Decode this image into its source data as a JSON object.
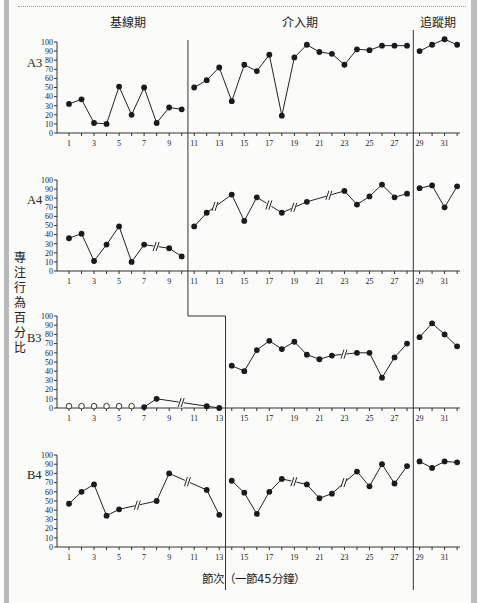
{
  "chart_data": {
    "type": "line",
    "subtype": "multiple-baseline single-subject design",
    "phases": [
      {
        "label": "基線期"
      },
      {
        "label": "介入期"
      },
      {
        "label": "追蹤期"
      }
    ],
    "ylabel": "專注行為百分比",
    "xlabel": "節次（一節45分鐘）",
    "ylim": [
      0,
      100
    ],
    "yticks": [
      0,
      10,
      20,
      30,
      40,
      50,
      60,
      70,
      80,
      90,
      100
    ],
    "xticks_labeled": [
      1,
      3,
      5,
      7,
      9,
      11,
      13,
      15,
      17,
      19,
      21,
      23,
      25,
      27,
      29,
      31
    ],
    "x_range": [
      1,
      32
    ],
    "grid": false,
    "series": [
      {
        "name": "A3",
        "phase_change_after": [
          10,
          28
        ],
        "points": [
          [
            1,
            32
          ],
          [
            2,
            37
          ],
          [
            3,
            11
          ],
          [
            4,
            10
          ],
          [
            5,
            51
          ],
          [
            6,
            20
          ],
          [
            7,
            50
          ],
          [
            8,
            11
          ],
          [
            9,
            28
          ],
          [
            10,
            26
          ],
          [
            11,
            50
          ],
          [
            12,
            58
          ],
          [
            13,
            72
          ],
          [
            14,
            35
          ],
          [
            15,
            75
          ],
          [
            16,
            68
          ],
          [
            17,
            86
          ],
          [
            18,
            19
          ],
          [
            19,
            83
          ],
          [
            20,
            97
          ],
          [
            21,
            89
          ],
          [
            22,
            87
          ],
          [
            23,
            75
          ],
          [
            24,
            92
          ],
          [
            25,
            91
          ],
          [
            26,
            96
          ],
          [
            27,
            96
          ],
          [
            28,
            96
          ],
          [
            29,
            90
          ],
          [
            30,
            97
          ],
          [
            31,
            103
          ],
          [
            32,
            97
          ]
        ],
        "breaks": []
      },
      {
        "name": "A4",
        "phase_change_after": [
          10,
          28
        ],
        "points": [
          [
            1,
            36
          ],
          [
            2,
            41
          ],
          [
            3,
            11
          ],
          [
            4,
            29
          ],
          [
            5,
            49
          ],
          [
            6,
            10
          ],
          [
            7,
            29
          ],
          [
            9,
            25
          ],
          [
            10,
            16
          ],
          [
            11,
            49
          ],
          [
            12,
            64
          ],
          [
            14,
            84
          ],
          [
            15,
            55
          ],
          [
            16,
            81
          ],
          [
            18,
            64
          ],
          [
            20,
            76
          ],
          [
            23,
            88
          ],
          [
            24,
            73
          ],
          [
            25,
            82
          ],
          [
            26,
            95
          ],
          [
            27,
            81
          ],
          [
            28,
            85
          ],
          [
            29,
            91
          ],
          [
            30,
            94
          ],
          [
            31,
            70
          ],
          [
            32,
            93
          ]
        ],
        "breaks": [
          8,
          12.7,
          17,
          19,
          21.8
        ]
      },
      {
        "name": "B3",
        "phase_change_after": [
          13,
          28
        ],
        "points": [
          [
            7,
            1
          ],
          [
            8,
            10
          ],
          [
            12,
            2
          ],
          [
            13,
            0
          ],
          [
            14,
            46
          ],
          [
            15,
            40
          ],
          [
            16,
            63
          ],
          [
            17,
            73
          ],
          [
            18,
            64
          ],
          [
            19,
            72
          ],
          [
            20,
            58
          ],
          [
            21,
            53
          ],
          [
            22,
            57
          ],
          [
            24,
            60
          ],
          [
            25,
            60
          ],
          [
            26,
            33
          ],
          [
            27,
            55
          ],
          [
            28,
            70
          ],
          [
            29,
            77
          ],
          [
            30,
            92
          ],
          [
            31,
            80
          ],
          [
            32,
            67
          ]
        ],
        "open_points": [
          [
            1,
            2
          ],
          [
            2,
            2
          ],
          [
            3,
            2
          ],
          [
            4,
            2
          ],
          [
            5,
            2
          ],
          [
            6,
            2
          ]
        ],
        "breaks": [
          10,
          23
        ]
      },
      {
        "name": "B4",
        "phase_change_after": [
          13,
          28
        ],
        "points": [
          [
            1,
            47
          ],
          [
            2,
            60
          ],
          [
            3,
            68
          ],
          [
            4,
            34
          ],
          [
            5,
            41
          ],
          [
            8,
            50
          ],
          [
            9,
            80
          ],
          [
            12,
            62
          ],
          [
            13,
            35
          ],
          [
            14,
            72
          ],
          [
            15,
            59
          ],
          [
            16,
            36
          ],
          [
            17,
            60
          ],
          [
            18,
            74
          ],
          [
            20,
            68
          ],
          [
            21,
            53
          ],
          [
            22,
            58
          ],
          [
            24,
            82
          ],
          [
            25,
            66
          ],
          [
            26,
            90
          ],
          [
            27,
            69
          ],
          [
            28,
            88
          ],
          [
            29,
            93
          ],
          [
            30,
            86
          ],
          [
            31,
            93
          ],
          [
            32,
            92
          ]
        ],
        "breaks": [
          6.5,
          10.5,
          19,
          23
        ]
      }
    ]
  },
  "labels": {
    "phase_baseline": "基線期",
    "phase_intervention": "介入期",
    "phase_followup": "追蹤期",
    "ylabel": "專注行為百分比",
    "xlabel": "節次（一節45分鐘）"
  }
}
